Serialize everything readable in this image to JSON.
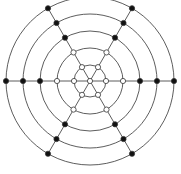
{
  "diagram": {
    "type": "concentric-graph",
    "center": [
      90,
      81
    ],
    "ring_radii": [
      16,
      33,
      50,
      67,
      84
    ],
    "spoke_angles_deg": [
      0,
      60,
      120,
      180,
      240,
      300
    ],
    "colors": {
      "stroke": "#333333",
      "filled_node": "#111111",
      "open_node": "#ffffff"
    },
    "open_nodes_rings": [
      0,
      1,
      2
    ],
    "filled_nodes_rings": [
      3,
      4,
      5
    ]
  }
}
